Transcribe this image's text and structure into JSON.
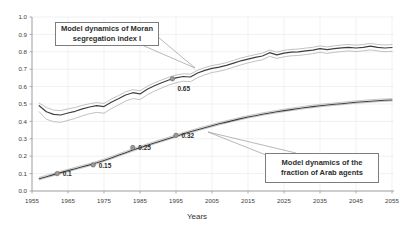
{
  "chart_data": {
    "type": "line",
    "title": "",
    "xlabel": "Years",
    "ylabel": "",
    "xlim": [
      1955,
      2055
    ],
    "ylim": [
      0.0,
      1.0
    ],
    "grid": true,
    "legend_position": "none",
    "x_ticks": [
      1955,
      1965,
      1975,
      1985,
      1995,
      2005,
      2015,
      2025,
      2035,
      2045,
      2055
    ],
    "y_ticks": [
      "0.0",
      "0.1",
      "0.2",
      "0.3",
      "0.4",
      "0.5",
      "0.6",
      "0.7",
      "0.8",
      "0.9",
      "1.0"
    ],
    "x": [
      1957,
      1959,
      1961,
      1963,
      1965,
      1967,
      1969,
      1971,
      1973,
      1975,
      1977,
      1979,
      1981,
      1983,
      1985,
      1987,
      1989,
      1991,
      1993,
      1995,
      1997,
      1999,
      2001,
      2003,
      2005,
      2007,
      2009,
      2011,
      2013,
      2015,
      2017,
      2019,
      2021,
      2023,
      2025,
      2027,
      2029,
      2031,
      2033,
      2035,
      2037,
      2039,
      2041,
      2043,
      2045,
      2047,
      2049,
      2051,
      2053,
      2055
    ],
    "series": [
      {
        "name": "moran-upper-bound",
        "color": "#b2b2b2",
        "width": 0.8,
        "values": [
          0.505,
          0.48,
          0.465,
          0.462,
          0.472,
          0.48,
          0.492,
          0.502,
          0.508,
          0.503,
          0.528,
          0.548,
          0.57,
          0.582,
          0.576,
          0.602,
          0.622,
          0.638,
          0.654,
          0.666,
          0.674,
          0.671,
          0.694,
          0.709,
          0.721,
          0.728,
          0.738,
          0.751,
          0.764,
          0.774,
          0.784,
          0.792,
          0.81,
          0.799,
          0.808,
          0.814,
          0.816,
          0.821,
          0.826,
          0.834,
          0.828,
          0.834,
          0.839,
          0.842,
          0.838,
          0.842,
          0.848,
          0.842,
          0.839,
          0.842
        ]
      },
      {
        "name": "moran-lower-bound",
        "color": "#b2b2b2",
        "width": 0.8,
        "values": [
          0.455,
          0.412,
          0.398,
          0.395,
          0.406,
          0.417,
          0.432,
          0.444,
          0.452,
          0.447,
          0.473,
          0.494,
          0.517,
          0.531,
          0.525,
          0.553,
          0.574,
          0.592,
          0.609,
          0.622,
          0.631,
          0.628,
          0.652,
          0.668,
          0.681,
          0.688,
          0.698,
          0.712,
          0.725,
          0.736,
          0.746,
          0.754,
          0.774,
          0.762,
          0.771,
          0.777,
          0.779,
          0.784,
          0.789,
          0.797,
          0.791,
          0.797,
          0.802,
          0.805,
          0.801,
          0.805,
          0.811,
          0.805,
          0.8,
          0.803
        ]
      },
      {
        "name": "moran-mean",
        "color": "#3f3f3f",
        "width": 1.2,
        "values": [
          0.49,
          0.455,
          0.44,
          0.437,
          0.448,
          0.458,
          0.472,
          0.483,
          0.49,
          0.485,
          0.51,
          0.53,
          0.552,
          0.565,
          0.558,
          0.585,
          0.605,
          0.622,
          0.638,
          0.65,
          0.658,
          0.655,
          0.678,
          0.693,
          0.705,
          0.712,
          0.722,
          0.735,
          0.748,
          0.758,
          0.768,
          0.776,
          0.795,
          0.783,
          0.792,
          0.798,
          0.8,
          0.805,
          0.81,
          0.818,
          0.812,
          0.818,
          0.823,
          0.826,
          0.822,
          0.826,
          0.832,
          0.826,
          0.822,
          0.825
        ]
      },
      {
        "name": "arab-fraction-upper-bound",
        "base": "arab-fraction-mean",
        "offset": 0.008,
        "color": "#adadad",
        "width": 0.7
      },
      {
        "name": "arab-fraction-lower-bound",
        "base": "arab-fraction-mean",
        "offset": -0.006,
        "color": "#adadad",
        "width": 0.7
      },
      {
        "name": "arab-fraction-mean",
        "color": "#3f3f3f",
        "width": 1.1,
        "values": [
          0.07,
          0.082,
          0.094,
          0.106,
          0.117,
          0.128,
          0.139,
          0.15,
          0.162,
          0.176,
          0.19,
          0.205,
          0.22,
          0.235,
          0.249,
          0.263,
          0.276,
          0.289,
          0.302,
          0.315,
          0.328,
          0.34,
          0.352,
          0.364,
          0.375,
          0.386,
          0.396,
          0.406,
          0.416,
          0.425,
          0.433,
          0.441,
          0.448,
          0.455,
          0.462,
          0.468,
          0.474,
          0.48,
          0.485,
          0.49,
          0.494,
          0.498,
          0.502,
          0.506,
          0.51,
          0.513,
          0.516,
          0.519,
          0.521,
          0.523
        ]
      }
    ],
    "markers": [
      {
        "x": 1962,
        "y": 0.1,
        "label": "0.1"
      },
      {
        "x": 1972,
        "y": 0.15,
        "label": "0.15"
      },
      {
        "x": 1983,
        "y": 0.25,
        "label": "0.25"
      },
      {
        "x": 1995,
        "y": 0.32,
        "label": "0.32"
      },
      {
        "x": 1994,
        "y": 0.645,
        "label": "0.65"
      }
    ],
    "marker_color": "#9a9a9a",
    "annotations": [
      {
        "id": "moran",
        "lines": [
          "Model dynamics of Moran",
          "segregation index I"
        ]
      },
      {
        "id": "arab",
        "lines": [
          "Model dynamics of the",
          "fraction of Arab agents"
        ]
      }
    ],
    "colors": {
      "grid": "#ebebeb",
      "axis": "#9a9a9a",
      "tick_label": "#3c3c3c",
      "leader_line": "#9a9a9a"
    }
  }
}
